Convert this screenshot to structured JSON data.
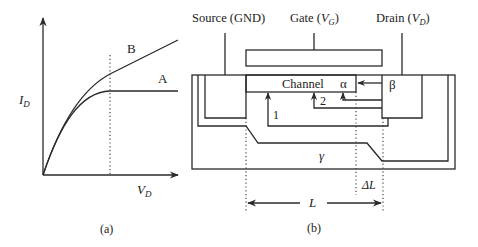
{
  "panel_a": {
    "caption": "(a)",
    "y_axis_label": "I",
    "y_axis_sub": "D",
    "x_axis_label": "V",
    "x_axis_sub": "D",
    "curve_a_label": "A",
    "curve_b_label": "B"
  },
  "panel_b": {
    "caption": "(b)",
    "source_label": "Source (GND)",
    "gate_label_prefix": "Gate (",
    "gate_label_var": "V",
    "gate_label_sub": "G",
    "gate_label_suffix": ")",
    "drain_label_prefix": "Drain (",
    "drain_label_var": "V",
    "drain_label_sub": "D",
    "drain_label_suffix": ")",
    "channel_label": "Channel",
    "alpha_label": "α",
    "beta_label": "β",
    "gamma_label": "γ",
    "path1_label": "1",
    "path2_label": "2",
    "length_label": "L",
    "delta_length_label": "ΔL"
  }
}
